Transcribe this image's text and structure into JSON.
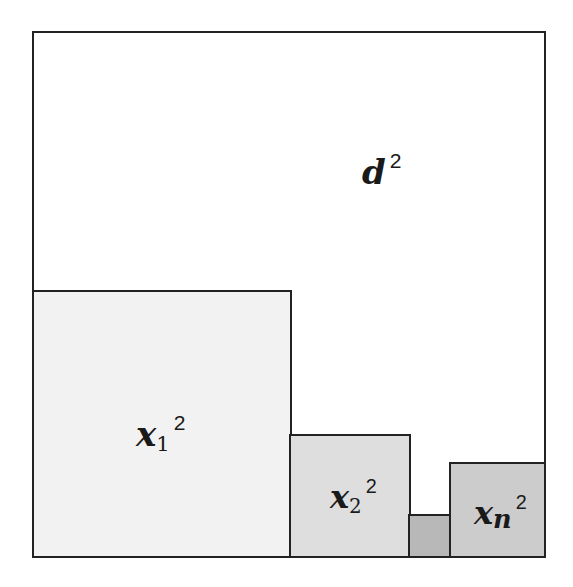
{
  "diagram": {
    "outer": {
      "label_base": "d",
      "label_exp": "2",
      "fill": "#ffffff"
    },
    "squares": [
      {
        "id": "x1",
        "base": "x",
        "sub": "1",
        "exp": "2",
        "fill": "#f2f2f2"
      },
      {
        "id": "x2",
        "base": "x",
        "sub": "2",
        "exp": "2",
        "fill": "#dedede"
      },
      {
        "id": "small",
        "fill": "#b8b8b8"
      },
      {
        "id": "xn",
        "base": "x",
        "sub": "n",
        "exp": "2",
        "fill": "#cccccc"
      }
    ],
    "stroke": "#222222"
  }
}
